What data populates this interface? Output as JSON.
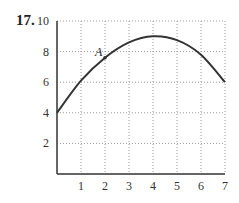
{
  "problem": {
    "number": "17."
  },
  "chart_data": {
    "type": "line",
    "title": "",
    "xlabel": "",
    "ylabel": "",
    "xlim": [
      0,
      7
    ],
    "ylim": [
      0,
      10
    ],
    "grid": true,
    "grid_style": "dotted",
    "x_ticks": [
      1,
      2,
      3,
      4,
      5,
      6,
      7
    ],
    "y_ticks": [
      2,
      4,
      6,
      8,
      10
    ],
    "x_tick_labels": [
      "1",
      "2",
      "3",
      "4",
      "5",
      "6",
      "7"
    ],
    "y_tick_labels": [
      "2",
      "4",
      "6",
      "8",
      "10"
    ],
    "series": [
      {
        "name": "f(x)",
        "x": [
          0,
          1,
          2,
          3,
          4,
          5,
          6,
          7
        ],
        "y": [
          4,
          6.1,
          7.6,
          8.6,
          9,
          8.75,
          7.8,
          6
        ]
      }
    ],
    "annotations": [
      {
        "label": "A",
        "x": 2,
        "y": 7.6
      }
    ],
    "colors": {
      "curve": "#333333",
      "grid": "#999999",
      "axis": "#333333"
    }
  }
}
